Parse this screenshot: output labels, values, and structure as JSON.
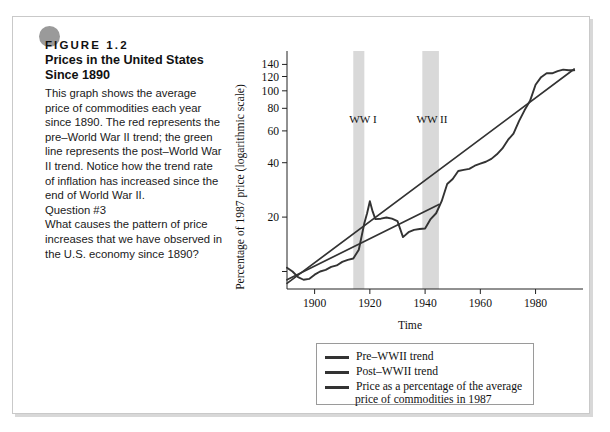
{
  "figure": {
    "label": "FIGURE  1.2",
    "title": "Prices in the United States Since 1890",
    "body": "This graph shows the average price of commodities each year since 1890. The red represents the pre–World War II trend; the green line represents the post–World War II trend. Notice how the trend rate of inflation has increased since the end of World War II.",
    "question_label": "Question #3",
    "question_text": "What causes the pattern of price increases that we have observed in the U.S. economy since 1890?"
  },
  "legend": {
    "items": [
      {
        "label": "Pre–WWII trend",
        "color": "#333333"
      },
      {
        "label": "Post–WWII trend",
        "color": "#333333"
      },
      {
        "label": "Price as a percentage of the average",
        "label2": "price of commodities in 1987",
        "color": "#333333"
      }
    ]
  },
  "chart_data": {
    "type": "line",
    "title": "",
    "xlabel": "Time",
    "ylabel": "Percentage of 1987 price (logarithmic scale)",
    "yscale": "log",
    "ylim": [
      8,
      150
    ],
    "xlim": [
      1890,
      1995
    ],
    "grid": false,
    "legend_position": "below-right",
    "yticks": [
      20,
      40,
      60,
      80,
      100,
      120,
      140
    ],
    "ytick_labels": [
      "20",
      "40",
      "60",
      "80",
      "100",
      "120",
      "140"
    ],
    "yticks_minor": [
      10
    ],
    "xticks": [
      1900,
      1920,
      1940,
      1960,
      1980
    ],
    "xtick_labels": [
      "1900",
      "1920",
      "1940",
      "1960",
      "1980"
    ],
    "annotations": [
      {
        "text": "WW I",
        "x": 1917.5,
        "band_start": 1914,
        "band_end": 1918
      },
      {
        "text": "WW II",
        "x": 1942.5,
        "band_start": 1939,
        "band_end": 1945
      }
    ],
    "series": [
      {
        "name": "Price as a percentage of the average price of commodities in 1987",
        "color": "#333333",
        "x": [
          1890,
          1892,
          1894,
          1896,
          1898,
          1900,
          1902,
          1904,
          1906,
          1908,
          1910,
          1912,
          1914,
          1916,
          1918,
          1919,
          1920,
          1921,
          1922,
          1924,
          1926,
          1928,
          1930,
          1932,
          1934,
          1936,
          1938,
          1940,
          1942,
          1944,
          1946,
          1948,
          1950,
          1952,
          1954,
          1956,
          1958,
          1960,
          1962,
          1964,
          1966,
          1968,
          1970,
          1972,
          1974,
          1976,
          1978,
          1980,
          1982,
          1984,
          1986,
          1988,
          1990,
          1992,
          1994
        ],
        "y": [
          10.5,
          10.0,
          9.3,
          9.0,
          9.1,
          9.6,
          10.0,
          10.2,
          10.6,
          10.8,
          11.3,
          11.6,
          11.8,
          13.2,
          18.5,
          21.0,
          24.5,
          21.5,
          19.5,
          19.6,
          19.9,
          19.6,
          19.0,
          15.5,
          16.5,
          17.0,
          17.2,
          17.3,
          19.5,
          21.0,
          24.5,
          30.5,
          32.5,
          36.0,
          36.5,
          37.0,
          38.5,
          39.5,
          40.5,
          42.0,
          44.5,
          48.0,
          53.5,
          58.0,
          68.0,
          78.0,
          88.0,
          108.0,
          119.0,
          125.0,
          125.0,
          128.5,
          131.0,
          130.0,
          130.0
        ]
      },
      {
        "name": "Pre–WWII trend",
        "color": "#333333",
        "x": [
          1890,
          1945
        ],
        "y": [
          9.0,
          23.5
        ]
      },
      {
        "name": "Post–WWII trend",
        "color": "#333333",
        "x": [
          1890,
          1994
        ],
        "y": [
          8.6,
          132.0
        ]
      }
    ]
  }
}
